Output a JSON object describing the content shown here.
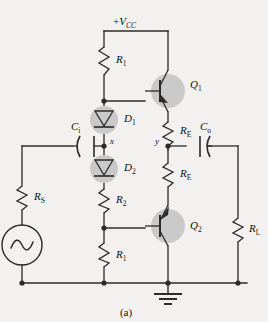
{
  "figure": {
    "caption": "(a)",
    "supply_label_prefix": "+",
    "supply_label_main": "V",
    "supply_label_sub": "CC",
    "type": "schematic"
  },
  "colors": {
    "background": "#f2f1ef",
    "wire": "#2b2b2b",
    "component_shade": "#c9c9c9",
    "text": "#111111"
  },
  "components": {
    "r1_top": {
      "main": "R",
      "sub": "1",
      "name": "resistor-r1-top"
    },
    "r1_bottom": {
      "main": "R",
      "sub": "1",
      "name": "resistor-r1-bottom"
    },
    "r2": {
      "main": "R",
      "sub": "2",
      "name": "resistor-r2"
    },
    "re_top": {
      "main": "R",
      "sub": "E",
      "name": "resistor-re-top"
    },
    "re_bottom": {
      "main": "R",
      "sub": "E",
      "name": "resistor-re-bottom"
    },
    "rs": {
      "main": "R",
      "sub": "S",
      "name": "resistor-rs"
    },
    "rl": {
      "main": "R",
      "sub": "L",
      "name": "resistor-rl"
    },
    "d1": {
      "main": "D",
      "sub": "1",
      "name": "diode-d1"
    },
    "d2": {
      "main": "D",
      "sub": "2",
      "name": "diode-d2"
    },
    "q1": {
      "main": "Q",
      "sub": "1",
      "name": "transistor-q1"
    },
    "q2": {
      "main": "Q",
      "sub": "2",
      "name": "transistor-q2"
    },
    "ci": {
      "main": "C",
      "sub": "i",
      "name": "capacitor-ci"
    },
    "co": {
      "main": "C",
      "sub": "o",
      "name": "capacitor-co"
    },
    "source": {
      "symbol": "sine",
      "name": "ac-source"
    },
    "ground": {
      "name": "ground-symbol"
    }
  },
  "nodes": {
    "x": "x",
    "y": "y"
  }
}
